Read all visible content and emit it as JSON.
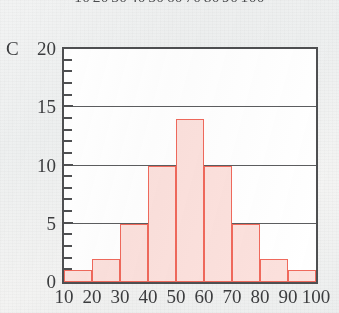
{
  "cropped_top_strip": {
    "name": "partial-axis-labels-from-figure-above",
    "labels": [
      "10",
      "20",
      "30",
      "40",
      "50",
      "60",
      "70",
      "80",
      "90",
      "100"
    ]
  },
  "chart_data": {
    "type": "bar",
    "title": "",
    "subtitle": "",
    "xlabel": "",
    "ylabel": "C",
    "series_label": "C",
    "categories": [
      "10-20",
      "20-30",
      "30-40",
      "40-50",
      "50-60",
      "60-70",
      "70-80",
      "80-90",
      "90-100"
    ],
    "bin_edges": [
      10,
      20,
      30,
      40,
      50,
      60,
      70,
      80,
      90,
      100
    ],
    "values": [
      1,
      2,
      5,
      10,
      14,
      10,
      5,
      2,
      1
    ],
    "xlim": [
      10,
      100
    ],
    "ylim": [
      0,
      20
    ],
    "x_tick_labels": [
      "10",
      "20",
      "30",
      "40",
      "50",
      "60",
      "70",
      "80",
      "90",
      "100"
    ],
    "x_tick_values": [
      10,
      20,
      30,
      40,
      50,
      60,
      70,
      80,
      90,
      100
    ],
    "y_tick_labels": [
      "0",
      "5",
      "10",
      "15",
      "20"
    ],
    "y_tick_values": [
      0,
      5,
      10,
      15,
      20
    ],
    "y_minor_tick_step": 1,
    "grid": "horizontal-major-only",
    "gridlines_at": [
      5,
      10,
      15
    ],
    "legend": "none",
    "legend_position": "none",
    "annotations": [],
    "colors": {
      "bar_fill": "#fce1dd",
      "bar_border": "#f0695c",
      "gridline": "#5c5d5f",
      "axis": "#4e4f51",
      "text": "#3c3d3f",
      "plot_background": "#ffffff",
      "page_background": "#f1f2f2"
    }
  }
}
